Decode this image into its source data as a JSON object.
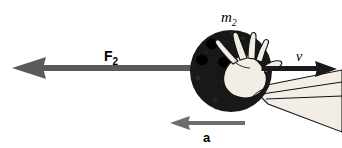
{
  "figure": {
    "background_color": "#ffffff",
    "width": 342,
    "height": 148
  },
  "labels": {
    "mass": {
      "symbol": "m",
      "subscript": "2",
      "name": "mass-label"
    },
    "force": {
      "symbol": "F",
      "subscript": "2",
      "name": "force-label"
    },
    "velocity": {
      "symbol": "v",
      "name": "velocity-label"
    },
    "acceleration": {
      "symbol": "a",
      "name": "acceleration-label"
    }
  },
  "colors": {
    "force_arrow": "#5a5a5a",
    "acceleration_arrow": "#6e6e6e",
    "velocity_arrow": "#1a1a1a",
    "ball_fill": "#191919",
    "ball_hole": "#000000",
    "hand_fill": "#f0ece2",
    "hand_outline": "#111111",
    "text": "#000000"
  },
  "vectors": [
    {
      "name": "force-vector-F2",
      "symbol": "F2",
      "direction": "left",
      "color": "#5a5a5a",
      "tail_x": 200,
      "tip_x": 12,
      "y": 68
    },
    {
      "name": "velocity-vector-v",
      "symbol": "v",
      "direction": "right",
      "color": "#1a1a1a",
      "tail_x": 262,
      "tip_x": 337,
      "y": 69
    },
    {
      "name": "acceleration-vector-a",
      "symbol": "a",
      "direction": "left",
      "color": "#6e6e6e",
      "tail_x": 245,
      "tip_x": 170,
      "y": 123
    }
  ],
  "ball": {
    "name": "bowling-ball",
    "center_x": 231,
    "center_y": 71,
    "radius": 41,
    "holes": [
      {
        "cx": 212,
        "cy": 44,
        "r": 6
      },
      {
        "cx": 202,
        "cy": 60,
        "r": 6
      },
      {
        "cx": 224,
        "cy": 62,
        "r": 6
      }
    ]
  },
  "hand": {
    "name": "hand-and-forearm",
    "description": "hand gripping ball with forearm extending to lower right"
  }
}
